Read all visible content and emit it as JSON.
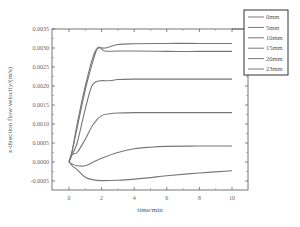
{
  "chart_data": {
    "type": "line",
    "title": "",
    "xlabel": "time/min",
    "ylabel": "z-direction flow velocity/(m/s)",
    "xlim": [
      -0.5,
      10.5
    ],
    "ylim": [
      -0.0008,
      0.0035
    ],
    "x_ticks": [
      "0",
      "2",
      "4",
      "6",
      "8",
      "10"
    ],
    "y_ticks": [
      "-0.0005",
      "0.0000",
      "0.0005",
      "0.0010",
      "0.0015",
      "0.0020",
      "0.0025",
      "0.0030",
      "0.0035"
    ],
    "grid": false,
    "legend_position": "upper right (outside plot edge)",
    "line_color": "#777777",
    "series": [
      {
        "name": "0mm",
        "x": [
          0,
          0.2,
          0.5,
          1.0,
          1.5,
          1.8,
          2.2,
          3,
          4,
          6,
          8,
          10
        ],
        "values": [
          0.0,
          0.0003,
          0.001,
          0.002,
          0.0028,
          0.003,
          0.003,
          0.00309,
          0.00311,
          0.00312,
          0.00312,
          0.00312
        ]
      },
      {
        "name": "5mm",
        "x": [
          0,
          0.2,
          0.5,
          1.0,
          1.5,
          1.8,
          2.2,
          3,
          4,
          6,
          8,
          10
        ],
        "values": [
          0.0,
          0.0003,
          0.0009,
          0.0019,
          0.0027,
          0.00302,
          0.00292,
          0.00292,
          0.00292,
          0.00291,
          0.00291,
          0.00291
        ]
      },
      {
        "name": "10mm",
        "x": [
          0,
          0.2,
          0.5,
          1.0,
          1.4,
          1.8,
          2.5,
          3,
          4,
          6,
          8,
          10
        ],
        "values": [
          0.0,
          0.0002,
          0.0005,
          0.0014,
          0.002,
          0.00213,
          0.00214,
          0.00217,
          0.00218,
          0.00218,
          0.00218,
          0.00218
        ]
      },
      {
        "name": "15mm",
        "x": [
          0,
          0.2,
          0.5,
          1.0,
          1.5,
          2.0,
          2.5,
          3,
          4,
          6,
          8,
          10
        ],
        "values": [
          0.0,
          0.0002,
          0.00025,
          0.0006,
          0.001,
          0.00122,
          0.00127,
          0.00129,
          0.0013,
          0.0013,
          0.0013,
          0.0013
        ]
      },
      {
        "name": "20mm",
        "x": [
          0,
          0.2,
          0.5,
          1.0,
          1.5,
          2.0,
          3.0,
          4.0,
          5,
          6,
          8,
          10
        ],
        "values": [
          0.0,
          -5e-05,
          -0.0001,
          -0.0001,
          0.0,
          0.0001,
          0.00025,
          0.00035,
          0.00039,
          0.00041,
          0.00042,
          0.00042
        ]
      },
      {
        "name": "23mm",
        "x": [
          0,
          0.2,
          0.5,
          1.0,
          1.5,
          2.0,
          3.0,
          4.0,
          5,
          6,
          8,
          10
        ],
        "values": [
          0.0,
          -0.0001,
          -0.0002,
          -0.0004,
          -0.00047,
          -0.00049,
          -0.00048,
          -0.00045,
          -0.00041,
          -0.00036,
          -0.00029,
          -0.00023
        ]
      }
    ]
  },
  "legend": {
    "items": [
      "0mm",
      "5mm",
      "10mm",
      "15mm",
      "20mm",
      "23mm"
    ]
  },
  "axes": {
    "xlabel": "time/min",
    "ylabel": "z-direction flow velocity/(m/s)",
    "x_ticks": [
      "0",
      "2",
      "4",
      "6",
      "8",
      "10"
    ],
    "y_ticks": [
      "-0.0005",
      "0.0000",
      "0.0005",
      "0.0010",
      "0.0015",
      "0.0020",
      "0.0025",
      "0.0030",
      "0.0035"
    ]
  }
}
